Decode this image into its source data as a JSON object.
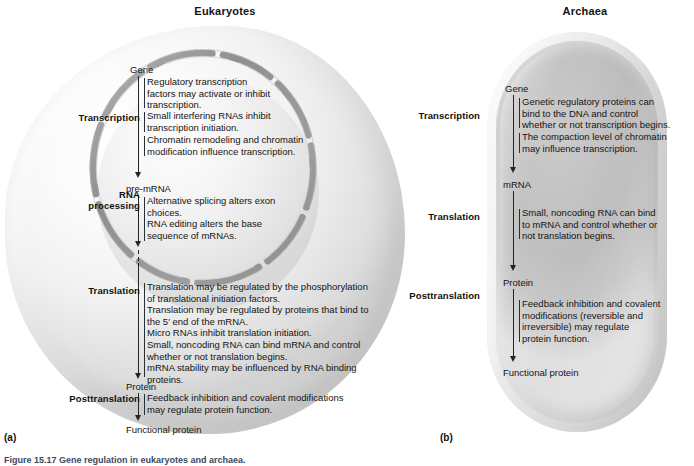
{
  "figure": {
    "caption": "Figure 15.17  Gene regulation in eukaryotes and archaea.",
    "marker_a": "(a)",
    "marker_b": "(b)"
  },
  "panels": {
    "eukaryotes": {
      "title": "Eukaryotes",
      "nodes": {
        "gene": "Gene",
        "pre_mrna": "pre-mRNA",
        "protein": "Protein",
        "functional_protein": "Functional protein"
      },
      "stages": [
        {
          "label": "Transcription",
          "blocks": [
            "Regulatory transcription\nfactors may activate or inhibit\ntranscription.",
            "Small interfering RNAs inhibit\ntranscription initiation.",
            "Chromatin remodeling and chromatin\nmodification influence transcription."
          ]
        },
        {
          "label": "RNA\nprocessing",
          "blocks": [
            "Alternative splicing alters exon\nchoices.\nRNA editing alters the base\nsequence of mRNAs."
          ]
        },
        {
          "label": "Translation",
          "blocks": [
            "Translation may be regulated by the phosphorylation\nof translational initiation factors.\nTranslation may be regulated by proteins that bind to\nthe 5′ end of the mRNA.\nMicro RNAs inhibit translation initiation.\nSmall, noncoding RNA can bind mRNA and control\nwhether or not translation begins.\nmRNA stability may be influenced by RNA binding\nproteins."
          ]
        },
        {
          "label": "Posttranslation",
          "blocks": [
            "Feedback inhibition and covalent modifications\nmay regulate protein function."
          ]
        }
      ]
    },
    "archaea": {
      "title": "Archaea",
      "nodes": {
        "gene": "Gene",
        "mrna": "mRNA",
        "protein": "Protein",
        "functional_protein": "Functional protein"
      },
      "stages": [
        {
          "label": "Transcription",
          "blocks": [
            "Genetic regulatory proteins can\nbind to the DNA and control\nwhether or not transcription begins.",
            "The compaction level of chromatin\nmay influence transcription."
          ]
        },
        {
          "label": "Translation",
          "blocks": [
            "Small, noncoding RNA can bind\nto mRNA and control whether or\nnot translation begins."
          ]
        },
        {
          "label": "Posttranslation",
          "blocks": [
            "Feedback inhibition and covalent\nmodifications (reversible and\nirreversible) may regulate\nprotein function."
          ]
        }
      ]
    }
  },
  "colors": {
    "text": "#141414",
    "arrow": "#20252b",
    "cell_fill": "#ededed",
    "nuclear_envelope": "#9a9a9a",
    "archaea_cytoplasm": "#c2c2c2",
    "caption": "#3b4a63"
  }
}
